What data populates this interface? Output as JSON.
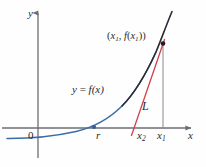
{
  "figure": {
    "axes": {
      "x_label": "x",
      "y_label": "y",
      "origin_label": "0"
    },
    "tick_labels": {
      "root": "r",
      "x2": "x",
      "x2_sub": "2",
      "x1": "x",
      "x1_sub": "1"
    },
    "annotations": {
      "curve_label_y": "y",
      "curve_label_eq": " = ",
      "curve_label_f": "f",
      "curve_label_arg": "(x)",
      "tangent_label": "L",
      "point_open": "(",
      "point_x1": "x",
      "point_x1_sub": "1",
      "point_comma": ", ",
      "point_f": "f",
      "point_inner_open": "(",
      "point_inner_x": "x",
      "point_inner_sub": "1",
      "point_inner_close": ")",
      "point_close": ")"
    },
    "colors": {
      "axis": "#6d6d73",
      "curve_blue": "#3a6ea8",
      "curve_dark": "#2b2b38",
      "tangent_red": "#d0414c",
      "drop_line": "#8a8a90",
      "text": "#2a2a33",
      "background": "#fefefe",
      "point_dot": "#1f1f28",
      "root_dot": "#3a5c96"
    },
    "geometry": {
      "x_axis_y": 128,
      "y_axis_x": 38,
      "root_x": 94,
      "x2_x": 134,
      "x1_x": 163,
      "point_y": 43
    }
  }
}
